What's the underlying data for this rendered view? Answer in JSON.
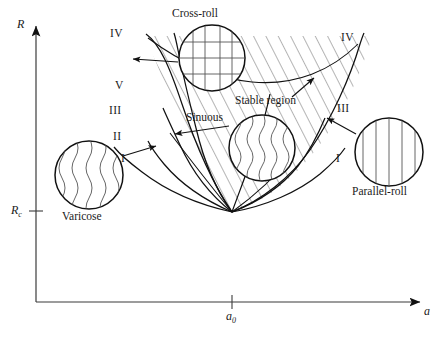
{
  "figure": {
    "type": "stability-balloon-diagram",
    "background": "#ffffff",
    "line_color": "#111111",
    "hatch_color": "#3a3a3a"
  },
  "axes": {
    "y_label": "R",
    "x_label": "a",
    "y_tick_label": "R",
    "y_tick_sub": "c",
    "x_tick_label": "a",
    "x_tick_sub": "0",
    "origin": {
      "x": 36,
      "y": 302
    },
    "y_top": {
      "x": 36,
      "y": 22
    },
    "x_right": {
      "x": 424,
      "y": 302
    },
    "y_tick": {
      "x": 36,
      "y": 211
    },
    "x_tick": {
      "x": 232,
      "y": 302
    }
  },
  "region_labels": [
    {
      "id": "cross-roll",
      "text": "Cross-roll",
      "x": 172,
      "y": 10
    },
    {
      "id": "stable-region",
      "text": "Stable region",
      "x": 235,
      "y": 96
    },
    {
      "id": "sinuous",
      "text": "Sinuous",
      "x": 186,
      "y": 113
    },
    {
      "id": "varicose",
      "text": "Varicose",
      "x": 62,
      "y": 212
    },
    {
      "id": "parallel-roll",
      "text": "Parallel-roll",
      "x": 352,
      "y": 187
    }
  ],
  "curve_labels": [
    {
      "id": "IV-left",
      "text": "IV",
      "x": 110,
      "y": 33
    },
    {
      "id": "V-left",
      "text": "V",
      "x": 113,
      "y": 85
    },
    {
      "id": "III-left",
      "text": "III",
      "x": 108,
      "y": 110
    },
    {
      "id": "II-left",
      "text": "II",
      "x": 112,
      "y": 136
    },
    {
      "id": "I-left",
      "text": "I",
      "x": 120,
      "y": 158
    },
    {
      "id": "IV-right",
      "text": "IV",
      "x": 341,
      "y": 37
    },
    {
      "id": "III-right",
      "text": "III",
      "x": 337,
      "y": 108
    },
    {
      "id": "I-right",
      "text": "I",
      "x": 335,
      "y": 158
    }
  ],
  "inset_circles": [
    {
      "id": "cross-roll-inset",
      "pattern": "grid",
      "cx": 212,
      "cy": 58,
      "r": 33
    },
    {
      "id": "sinuous-inset",
      "pattern": "wavy",
      "cx": 262,
      "cy": 148,
      "r": 33
    },
    {
      "id": "varicose-inset",
      "pattern": "wavy",
      "cx": 89,
      "cy": 175,
      "r": 34
    },
    {
      "id": "parallel-roll-inset",
      "pattern": "straight",
      "cx": 389,
      "cy": 152,
      "r": 34
    }
  ],
  "annotation_arrows": [
    {
      "id": "arrow-cross-roll-IV",
      "from_x": 178,
      "from_y": 62,
      "to_x": 133,
      "to_y": 59
    },
    {
      "id": "arrow-stable-region",
      "from_x": 292,
      "from_y": 97,
      "to_x": 314,
      "to_y": 78
    },
    {
      "id": "arrow-sinuous",
      "from_x": 229,
      "from_y": 126,
      "to_x": 175,
      "to_y": 134
    },
    {
      "id": "arrow-varicose-II",
      "from_x": 123,
      "from_y": 156,
      "to_x": 156,
      "to_y": 146
    },
    {
      "id": "arrow-parallel-III",
      "from_x": 356,
      "from_y": 134,
      "to_x": 327,
      "to_y": 118
    }
  ],
  "curves": {
    "vertex": {
      "x": 232,
      "y": 212
    },
    "description": "Nested Busse-balloon boundary curves I-V emanating from a common vertex at (a0, Rc)."
  }
}
